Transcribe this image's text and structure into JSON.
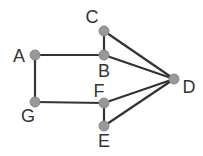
{
  "diagram": {
    "type": "graph",
    "background": "#ffffff",
    "edge_color": "#333333",
    "node_color": "#999999",
    "nodes": [
      {
        "id": "A",
        "label": "A",
        "x": 35,
        "y": 55,
        "label_x": 19,
        "label_y": 62,
        "anchor": "middle"
      },
      {
        "id": "B",
        "label": "B",
        "x": 104,
        "y": 55,
        "label_x": 104,
        "label_y": 77,
        "anchor": "middle"
      },
      {
        "id": "C",
        "label": "C",
        "x": 104,
        "y": 31,
        "label_x": 92,
        "label_y": 23,
        "anchor": "middle"
      },
      {
        "id": "D",
        "label": "D",
        "x": 174,
        "y": 79,
        "label_x": 189,
        "label_y": 93,
        "anchor": "middle"
      },
      {
        "id": "F",
        "label": "F",
        "x": 104,
        "y": 103,
        "label_x": 99,
        "label_y": 97,
        "anchor": "middle"
      },
      {
        "id": "E",
        "label": "E",
        "x": 104,
        "y": 126,
        "label_x": 104,
        "label_y": 147,
        "anchor": "middle"
      },
      {
        "id": "G",
        "label": "G",
        "x": 35,
        "y": 102,
        "label_x": 28,
        "label_y": 122,
        "anchor": "middle"
      }
    ],
    "edges": [
      [
        "A",
        "B"
      ],
      [
        "A",
        "G"
      ],
      [
        "G",
        "F"
      ],
      [
        "C",
        "B"
      ],
      [
        "C",
        "D"
      ],
      [
        "B",
        "D"
      ],
      [
        "F",
        "D"
      ],
      [
        "E",
        "D"
      ],
      [
        "F",
        "E"
      ]
    ]
  }
}
